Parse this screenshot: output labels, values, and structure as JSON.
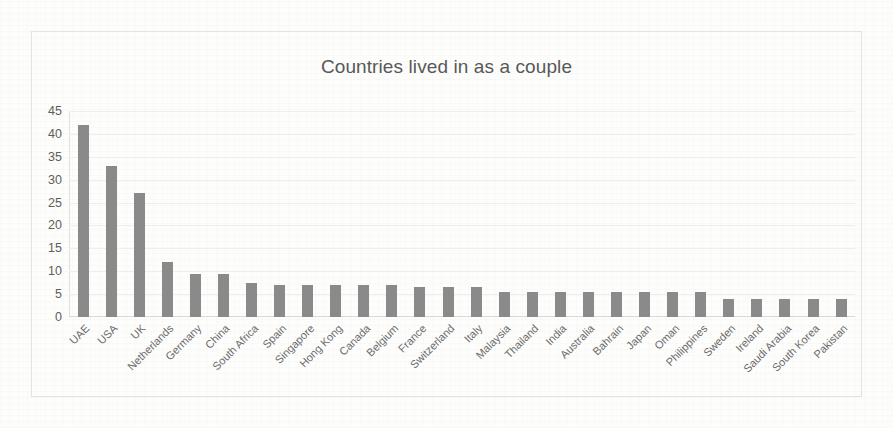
{
  "chart_data": {
    "type": "bar",
    "title": "Countries lived in as a couple",
    "xlabel": "",
    "ylabel": "",
    "ylim": [
      0,
      45
    ],
    "ytick_step": 5,
    "yticks": [
      45,
      40,
      35,
      30,
      25,
      20,
      15,
      10,
      5,
      0
    ],
    "grid": true,
    "legend": false,
    "bar_color": "#8a8a8a",
    "orientation": "vertical",
    "categories": [
      "UAE",
      "USA",
      "UK",
      "Netherlands",
      "Germany",
      "China",
      "South Africa",
      "Spain",
      "Singapore",
      "Hong Kong",
      "Canada",
      "Belgium",
      "France",
      "Switzerland",
      "Italy",
      "Malaysia",
      "Thailand",
      "India",
      "Australia",
      "Bahrain",
      "Japan",
      "Oman",
      "Philippines",
      "Sweden",
      "Ireland",
      "Saudi Arabia",
      "South Korea",
      "Pakistan"
    ],
    "values": [
      42,
      33,
      27,
      12,
      9.5,
      9.5,
      7.5,
      7,
      7,
      7,
      7,
      7,
      6.5,
      6.5,
      6.5,
      5.5,
      5.5,
      5.5,
      5.5,
      5.5,
      5.5,
      5.5,
      5.5,
      4,
      4,
      4,
      4,
      4
    ]
  }
}
